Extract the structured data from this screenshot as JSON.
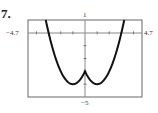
{
  "problem_number": "7.",
  "chart_data": {
    "type": "line",
    "title": "",
    "xlabel": "",
    "ylabel": "",
    "xlim": [
      -4.7,
      4.7
    ],
    "ylim": [
      -5,
      1
    ],
    "tick_labels": {
      "x_min": "−4.7",
      "x_max": "4.7",
      "y_min": "−5",
      "y_max": "1"
    },
    "x_ticks_step": 1,
    "y_ticks_step": 1,
    "grid": false,
    "series": [
      {
        "name": "f(x)",
        "x": [
          -3.24,
          -3,
          -2.5,
          -2,
          -1.5,
          -1,
          -0.5,
          0,
          0.5,
          1,
          1.5,
          2,
          2.5,
          3,
          3.24
        ],
        "y": [
          1,
          0,
          -1.75,
          -3,
          -3.75,
          -4,
          -3.75,
          -3,
          -3.75,
          -4,
          -3.75,
          -3,
          -1.75,
          0,
          1
        ]
      }
    ],
    "colors": {
      "curve": "#111111",
      "frame": "#555555",
      "axes": "#777777"
    }
  }
}
